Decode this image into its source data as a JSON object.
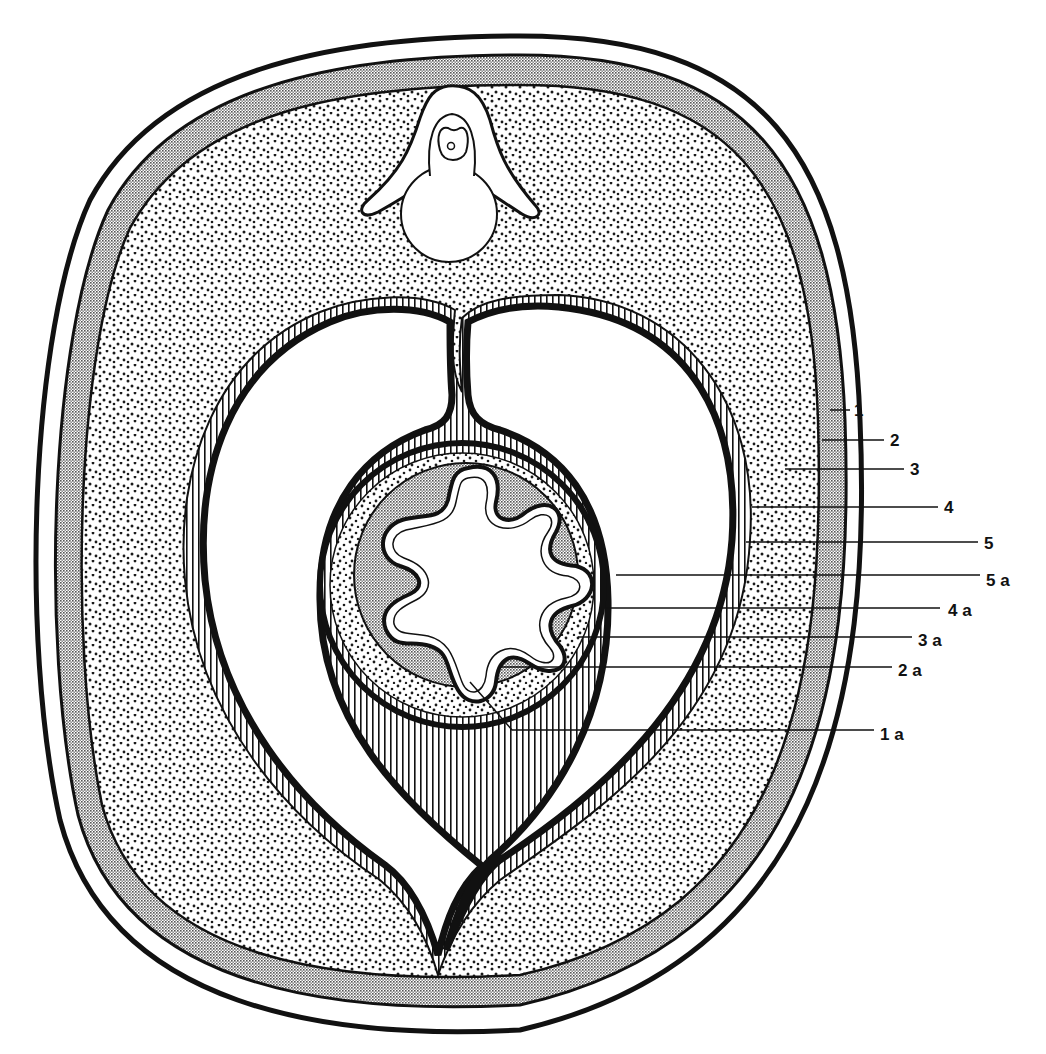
{
  "figure": {
    "type": "cross-section-schematic",
    "colors": {
      "ink": "#111111",
      "paper": "#ffffff",
      "hatch_fill": "#8a8a8a",
      "dot": "#1a1a1a"
    },
    "labels": [
      {
        "id": "1",
        "text": "1",
        "tx": 854,
        "ty": 413,
        "lx1": 840,
        "ly1": 410,
        "lx2": 850,
        "ly2": 410
      },
      {
        "id": "2",
        "text": "2",
        "tx": 890,
        "ty": 443,
        "lx1": 826,
        "ly1": 440,
        "lx2": 884,
        "ly2": 440
      },
      {
        "id": "3",
        "text": "3",
        "tx": 910,
        "ty": 472,
        "lx1": 785,
        "ly1": 469,
        "lx2": 904,
        "ly2": 469
      },
      {
        "id": "4",
        "text": "4",
        "tx": 944,
        "ty": 510,
        "lx1": 750,
        "ly1": 507,
        "lx2": 938,
        "ly2": 507
      },
      {
        "id": "5",
        "text": "5",
        "tx": 984,
        "ty": 546,
        "lx1": 745,
        "ly1": 542,
        "lx2": 978,
        "ly2": 542
      },
      {
        "id": "5a",
        "text": "5 a",
        "tx": 986,
        "ty": 584,
        "lx1": 616,
        "ly1": 575,
        "lx2": 980,
        "ly2": 575
      },
      {
        "id": "4a",
        "text": "4 a",
        "tx": 948,
        "ty": 614,
        "lx1": 606,
        "ly1": 608,
        "lx2": 940,
        "ly2": 608
      },
      {
        "id": "3a",
        "text": "3 a",
        "tx": 918,
        "ty": 644,
        "lx1": 580,
        "ly1": 637,
        "lx2": 912,
        "ly2": 637
      },
      {
        "id": "2a",
        "text": "2 a",
        "tx": 898,
        "ty": 674,
        "lx1": 500,
        "ly1": 667,
        "lx2": 892,
        "ly2": 667
      },
      {
        "id": "1a",
        "text": "1 a",
        "tx": 880,
        "ty": 738,
        "lx1": 512,
        "ly1": 730,
        "lx2": 874,
        "ly2": 730
      }
    ]
  }
}
